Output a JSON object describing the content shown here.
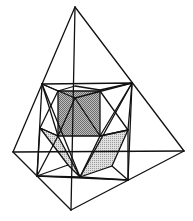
{
  "figure": {
    "colors": {
      "line": "#111111",
      "shade_dark": "#9a9a9a",
      "shade_light": "#c4c4c4",
      "background": "#ffffff"
    },
    "vertices": {
      "apex": [
        75,
        7
      ],
      "left": [
        13,
        152
      ],
      "right": [
        184,
        151
      ],
      "bottom": [
        71,
        210
      ],
      "sq_tl": [
        42,
        84
      ],
      "sq_tr": [
        132,
        83
      ],
      "sq_br": [
        128,
        180
      ],
      "sq_bl": [
        37,
        176
      ]
    }
  }
}
